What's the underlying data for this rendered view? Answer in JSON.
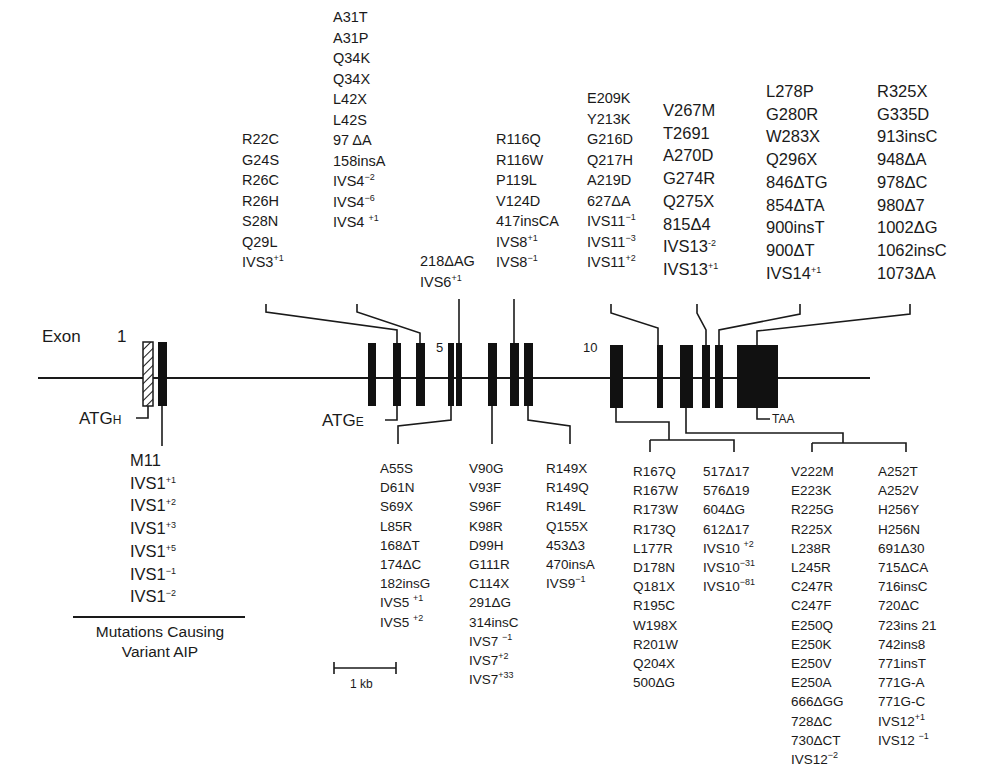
{
  "diagram": {
    "exon_label": "Exon",
    "exon_numbers": [
      "1",
      "5",
      "10"
    ],
    "atg_h": {
      "main": "ATG",
      "sub": "H"
    },
    "atg_e": {
      "main": "ATG",
      "sub": "E"
    },
    "stop_codon": "TAA",
    "scale_bar": "1 kb",
    "variant_caption_line1": "Mutations Causing",
    "variant_caption_line2": "Variant AIP",
    "line_color": "#1a1a1a",
    "exon_fill": "#111111"
  },
  "groups_above": [
    {
      "id": "exon3",
      "items": [
        "R22C",
        "G24S",
        "R26C",
        "R26H",
        "S28N",
        "Q29L",
        {
          "t": "IVS3",
          "s": "+1"
        }
      ]
    },
    {
      "id": "exon4",
      "items": [
        "A31T",
        "A31P",
        "Q34K",
        "Q34X",
        "L42X",
        "L42S",
        "97 ΔA",
        "158insA",
        {
          "t": "IVS4",
          "s": "−2"
        },
        {
          "t": "IVS4",
          "s": "−6"
        },
        {
          "t": "IVS4 ",
          "s": "+1"
        }
      ]
    },
    {
      "id": "exon6",
      "items": [
        "218ΔAG",
        {
          "t": "IVS6",
          "s": "+1"
        }
      ]
    },
    {
      "id": "exon8",
      "items": [
        "R116Q",
        "R116W",
        "P119L",
        "V124D",
        "417insCA",
        {
          "t": "IVS8",
          "s": "+1"
        },
        {
          "t": "IVS8",
          "s": "−1"
        }
      ]
    },
    {
      "id": "exon11",
      "items": [
        "E209K",
        "Y213K",
        "G216D",
        "Q217H",
        "A219D",
        "627ΔA",
        {
          "t": "IVS11",
          "s": "−1"
        },
        {
          "t": "IVS11",
          "s": "−3"
        },
        {
          "t": "IVS11",
          "s": "+2"
        }
      ]
    },
    {
      "id": "exon13",
      "items": [
        "V267M",
        "T2691",
        "A270D",
        "G274R",
        "Q275X",
        "815Δ4",
        {
          "t": "IVS13",
          "s": "-2"
        },
        {
          "t": "IVS13",
          "s": "+1"
        }
      ]
    },
    {
      "id": "exon14",
      "items": [
        "L278P",
        "G280R",
        "W283X",
        "Q296X",
        "846ΔTG",
        "854ΔTA",
        "900insT",
        "900ΔT",
        {
          "t": "IVS14",
          "s": "+1"
        }
      ]
    },
    {
      "id": "exon15",
      "items": [
        "R325X",
        "G335D",
        "913insC",
        "948ΔA",
        "978ΔC",
        "980Δ7",
        "1002ΔG",
        "1062insC",
        "1073ΔA"
      ]
    }
  ],
  "groups_below": [
    {
      "id": "exon1",
      "items": [
        "M11",
        {
          "t": "IVS1",
          "s": "+1"
        },
        {
          "t": "IVS1",
          "s": "+2"
        },
        {
          "t": "IVS1",
          "s": "+3"
        },
        {
          "t": "IVS1",
          "s": "+5"
        },
        {
          "t": "IVS1",
          "s": "−1"
        },
        {
          "t": "IVS1",
          "s": "−2"
        }
      ]
    },
    {
      "id": "exon5",
      "items": [
        "A55S",
        "D61N",
        "S69X",
        "L85R",
        "168ΔT",
        "174ΔC",
        "182insG",
        {
          "t": "IVS5 ",
          "s": "+1"
        },
        {
          "t": "IVS5 ",
          "s": "+2"
        }
      ]
    },
    {
      "id": "exon7",
      "items": [
        "V90G",
        "V93F",
        "S96F",
        "K98R",
        "D99H",
        "G111R",
        "C114X",
        "291ΔG",
        "314insC",
        {
          "t": "IVS7 ",
          "s": "−1"
        },
        {
          "t": "IVS7",
          "s": "+2"
        },
        {
          "t": "IVS7",
          "s": "+33"
        }
      ]
    },
    {
      "id": "exon9",
      "items": [
        "R149X",
        "R149Q",
        "R149L",
        "Q155X",
        "453Δ3",
        "470insA",
        {
          "t": "IVS9",
          "s": "−1"
        }
      ]
    },
    {
      "id": "exon10a",
      "items": [
        "R167Q",
        "R167W",
        "R173W",
        "R173Q",
        "L177R",
        "D178N",
        "Q181X",
        "R195C",
        "W198X",
        "R201W",
        "Q204X",
        "500ΔG"
      ]
    },
    {
      "id": "exon10b",
      "items": [
        "517Δ17",
        "576Δ19",
        "604ΔG",
        "612Δ17",
        {
          "t": "IVS10 ",
          "s": "+2"
        },
        {
          "t": "IVS10",
          "s": "−31"
        },
        {
          "t": "IVS10",
          "s": "−81"
        }
      ]
    },
    {
      "id": "exon12a",
      "items": [
        "V222M",
        "E223K",
        "R225G",
        "R225X",
        "L238R",
        "L245R",
        "C247R",
        "C247F",
        "E250Q",
        "E250K",
        "E250V",
        "E250A",
        "666ΔGG",
        "728ΔC",
        "730ΔCT",
        {
          "t": "IVS12",
          "s": "−2"
        }
      ]
    },
    {
      "id": "exon12b",
      "items": [
        "A252T",
        "A252V",
        "H256Y",
        "H256N",
        "691Δ30",
        "715ΔCA",
        "716insC",
        "720ΔC",
        "723ins 21",
        "742ins8",
        "771insT",
        "771G-A",
        "771G-C",
        {
          "t": "IVS12",
          "s": "+1"
        },
        {
          "t": "IVS12 ",
          "s": "−1"
        }
      ]
    }
  ]
}
